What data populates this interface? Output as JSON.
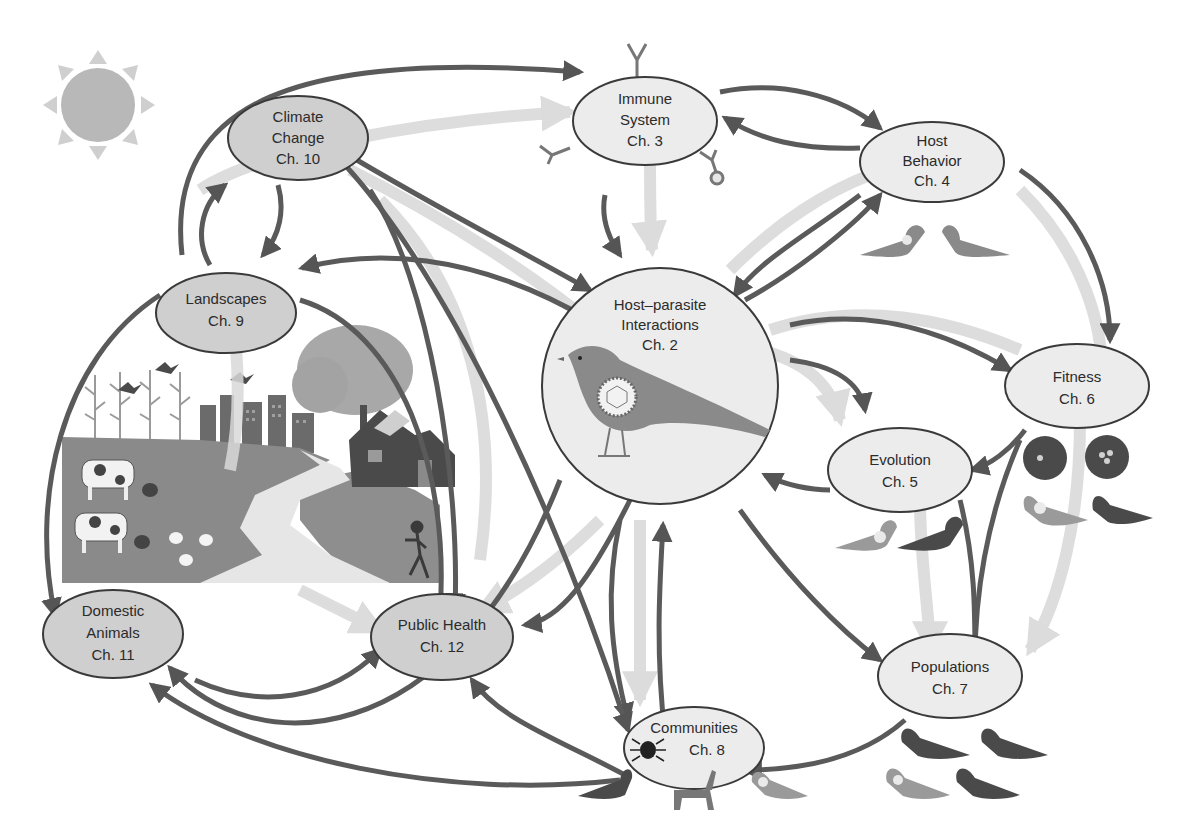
{
  "diagram": {
    "type": "concept-map",
    "colors": {
      "background": "#ffffff",
      "node_fill_light": "#eaeaea",
      "node_fill_dark": "#cfcfcf",
      "node_stroke": "#3a3a3a",
      "arrow_dark": "#555555",
      "arrow_light": "#d4d4d4",
      "sun": "#b8b8b8",
      "sun_rays": "#cccccc"
    },
    "nodes": {
      "host_parasite": {
        "lines": [
          "Host–parasite",
          "Interactions",
          "Ch. 2"
        ]
      },
      "immune": {
        "lines": [
          "Immune",
          "System",
          "Ch. 3"
        ]
      },
      "host_behavior": {
        "lines": [
          "Host",
          "Behavior",
          "Ch. 4"
        ]
      },
      "evolution": {
        "lines": [
          "Evolution",
          "Ch. 5"
        ]
      },
      "fitness": {
        "lines": [
          "Fitness",
          "Ch. 6"
        ]
      },
      "populations": {
        "lines": [
          "Populations",
          "Ch. 7"
        ]
      },
      "communities": {
        "lines": [
          "Communities",
          "Ch. 8"
        ]
      },
      "landscapes": {
        "lines": [
          "Landscapes",
          "Ch. 9"
        ]
      },
      "climate": {
        "lines": [
          "Climate",
          "Change",
          "Ch. 10"
        ]
      },
      "domestic": {
        "lines": [
          "Domestic",
          "Animals",
          "Ch. 11"
        ]
      },
      "public_health": {
        "lines": [
          "Public Health",
          "Ch. 12"
        ]
      }
    },
    "illustrations": {
      "sun": "sun-icon",
      "landscape_scene": [
        "cornfield",
        "city-skyline",
        "tree",
        "house-with-solar-panels",
        "winding-path",
        "cows",
        "chickens",
        "runner",
        "flying-birds"
      ],
      "immune_antibodies": "antibody-icon",
      "host_bird": "bird-with-parasite-icon",
      "nests": "bird-nest-icon",
      "communities_fauna": [
        "tick-icon",
        "deer-icon",
        "bird-icon"
      ]
    }
  }
}
